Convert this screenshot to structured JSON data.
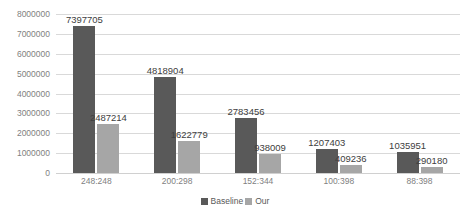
{
  "chart_data": {
    "type": "bar",
    "title": "",
    "xlabel": "",
    "ylabel": "",
    "categories": [
      "248:248",
      "200:298",
      "152:344",
      "100:398",
      "88:398"
    ],
    "series": [
      {
        "name": "Baseline",
        "color": "#595959",
        "values": [
          7397705,
          4818904,
          2783456,
          1207403,
          1035951
        ],
        "labels": [
          "7397705",
          "4818904",
          "2783456",
          "1207403",
          "1035951"
        ]
      },
      {
        "name": "Our",
        "color": "#a6a6a6",
        "values": [
          2487214,
          1622779,
          938009,
          409236,
          290180
        ],
        "labels": [
          "2487214",
          "1622779",
          "938009",
          "409236",
          "290180"
        ]
      }
    ],
    "ylim": [
      0,
      8000000
    ],
    "ytick_values": [
      0,
      1000000,
      2000000,
      3000000,
      4000000,
      5000000,
      6000000,
      7000000,
      8000000
    ],
    "ytick_labels": [
      "0",
      "1000000",
      "2000000",
      "3000000",
      "4000000",
      "5000000",
      "6000000",
      "7000000",
      "8000000"
    ],
    "grid": true,
    "legend_position": "bottom",
    "legend": [
      "Baseline",
      "Our"
    ]
  },
  "legend": {
    "items": [
      {
        "label": "Baseline",
        "color": "#595959"
      },
      {
        "label": "Our",
        "color": "#a6a6a6"
      }
    ]
  },
  "colors": {
    "baseline": "#595959",
    "our": "#a6a6a6",
    "gridline": "#d9d9d9",
    "tick_text": "#7f7f7f",
    "label_text": "#404040",
    "background": "#ffffff"
  }
}
